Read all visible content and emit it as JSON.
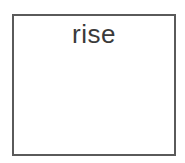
{
  "card": {
    "word": "rise",
    "border_color": "#5a5a5a",
    "text_color": "#3a3a3a"
  }
}
